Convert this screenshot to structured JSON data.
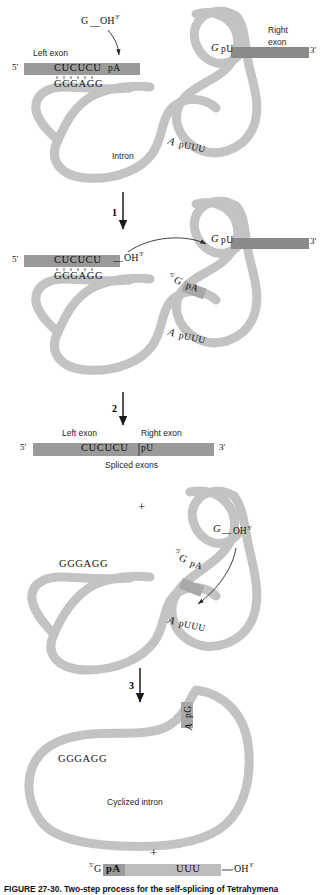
{
  "figure": {
    "caption": "FIGURE 27-30. Two-step process for the self-splicing of Tetrahymena",
    "colors": {
      "intron_ribbon": "#c3c3c3",
      "exon_bar": "#9a9a9a",
      "exon_bar_dark": "#8a8a8a",
      "text": "#111111",
      "background": "#ffffff"
    }
  },
  "panels": [
    {
      "id": "panel-1",
      "name": "pre-mrna",
      "labels": {
        "guanosine": "G",
        "guanosine_oh": "OH",
        "guanosine_oh_prime": "3'",
        "left_exon": "Left exon",
        "right_exon_line1": "Right",
        "right_exon_line2": "exon",
        "five_prime": "5'",
        "three_prime": "3'",
        "exon_seq": "CUCUCU",
        "splice_site_5": "pA",
        "intron_pair_seq": "GGGAGG",
        "intron_label": "Intron",
        "branch_a": "A",
        "branch_puuu": "pUUU",
        "three_ss_g": "G",
        "three_ss_pu": "pU"
      }
    },
    {
      "id": "panel-2",
      "name": "first-transesterification",
      "labels": {
        "step_number": "1",
        "five_prime": "5'",
        "three_prime": "3'",
        "exon_seq": "CUCUCU",
        "exon_oh": "OH",
        "exon_oh_prime": "3'",
        "intron_pair_seq": "GGGAGG",
        "intron_g_prime": "5'",
        "intron_g": "G",
        "intron_pa": "pA",
        "branch_a": "A",
        "branch_puuu": "pUUU",
        "three_ss_g": "G",
        "three_ss_pu": "pU"
      }
    },
    {
      "id": "panel-3",
      "name": "spliced-exons",
      "labels": {
        "step_number": "2",
        "left_exon": "Left exon",
        "right_exon": "Right exon",
        "five_prime": "5'",
        "three_prime": "3'",
        "joined_seq_left": "CUCUCU",
        "joined_seq_right": "pU",
        "product_label": "Spliced exons"
      }
    },
    {
      "id": "panel-4",
      "name": "linear-intron",
      "labels": {
        "plus": "+",
        "pair_seq": "GGGAGG",
        "terminal_g": "G",
        "terminal_oh": "OH",
        "terminal_oh_prime": "3'",
        "intron_g_prime": "5'",
        "intron_g": "G",
        "intron_pa": "pA",
        "branch_a": "A",
        "branch_puuu": "pUUU"
      }
    },
    {
      "id": "panel-5",
      "name": "cyclized-intron",
      "labels": {
        "step_number": "3",
        "pair_seq": "GGGAGG",
        "circle_a": "A",
        "circle_pg": "pG",
        "product_label": "Cyclized intron",
        "plus": "+",
        "frag_five_prime": "5'",
        "frag_g": "G",
        "frag_pa": "pA",
        "frag_uuu": "UUU",
        "frag_oh": "OH",
        "frag_oh_prime": "3'"
      }
    }
  ]
}
